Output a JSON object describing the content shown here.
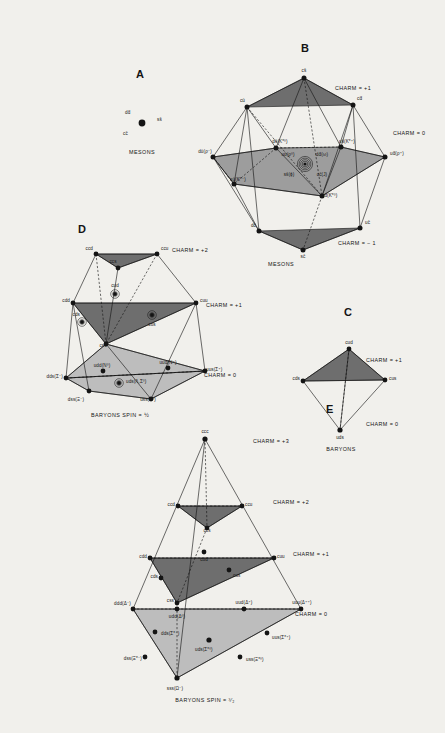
{
  "figure": {
    "panels": [
      {
        "id": "A",
        "label": "A",
        "caption": "MESONS",
        "nodes": [
          {
            "name": "dd-bar",
            "label": "dd̄",
            "x": 125,
            "y": 113,
            "dot": false
          },
          {
            "name": "ss-bar",
            "label": "ss̄",
            "x": 157,
            "y": 118,
            "dot": false
          },
          {
            "name": "cc-bar",
            "label": "cc̄",
            "x": 123,
            "y": 134,
            "dot": false
          },
          {
            "name": "center-dot",
            "label": "",
            "x": 142,
            "y": 123,
            "dot": true
          }
        ]
      },
      {
        "id": "B",
        "label": "B",
        "caption": "MESONS",
        "charm_labels": [
          {
            "text": "CHARM = +1",
            "x": 335,
            "y": 88
          },
          {
            "text": "CHARM = 0",
            "x": 393,
            "y": 133
          },
          {
            "text": "CHARM = − 1",
            "x": 338,
            "y": 243
          }
        ],
        "nodes": [
          {
            "name": "cs-bar",
            "label": "cs̄",
            "x": 304,
            "y": 73
          },
          {
            "name": "cu-bar",
            "label": "cū",
            "x": 243,
            "y": 102
          },
          {
            "name": "cd-bar",
            "label": "cd̄",
            "x": 358,
            "y": 100
          },
          {
            "name": "ds-bar",
            "label": "ds̄(K*⁰)",
            "x": 271,
            "y": 144
          },
          {
            "name": "us-bar",
            "label": "us̄(K*⁺)",
            "x": 339,
            "y": 143
          },
          {
            "name": "su-bar",
            "label": "sū(K*⁻)",
            "x": 230,
            "y": 179
          },
          {
            "name": "sd-bar",
            "label": "sd̄(K*⁰)",
            "x": 318,
            "y": 191
          },
          {
            "name": "du-bar",
            "label": "dū(ρ⁻)",
            "x": 212,
            "y": 152
          },
          {
            "name": "ud-bar",
            "label": "ud̄(ρ⁺)",
            "x": 392,
            "y": 152
          },
          {
            "name": "uu-bar",
            "label": "uū(ρ⁰)",
            "x": 288,
            "y": 156
          },
          {
            "name": "dd-bar",
            "label": "dd̄(ω)",
            "x": 320,
            "y": 156
          },
          {
            "name": "ss-bar",
            "label": "ss̄(ϕ)",
            "x": 289,
            "y": 172
          },
          {
            "name": "cc-bar",
            "label": "cc̄(J)",
            "x": 320,
            "y": 172
          },
          {
            "name": "dc-bar",
            "label": "dc̄",
            "x": 256,
            "y": 226
          },
          {
            "name": "uc-bar",
            "label": "uc̄",
            "x": 364,
            "y": 223
          },
          {
            "name": "sc-bar",
            "label": "sc̄",
            "x": 303,
            "y": 255
          }
        ]
      },
      {
        "id": "C",
        "label": "C",
        "caption": "BARYONS",
        "charm_labels": [
          {
            "text": "CHARM = +1",
            "x": 366,
            "y": 360
          },
          {
            "text": "CHARM = 0",
            "x": 366,
            "y": 424
          }
        ],
        "nodes": [
          {
            "name": "cud",
            "label": "cud",
            "x": 349,
            "y": 344
          },
          {
            "name": "cds",
            "label": "cds",
            "x": 292,
            "y": 377
          },
          {
            "name": "cus",
            "label": "cus",
            "x": 390,
            "y": 376
          },
          {
            "name": "uds",
            "label": "uds",
            "x": 340,
            "y": 434
          }
        ]
      },
      {
        "id": "D",
        "label": "D",
        "caption": "BARYONS SPIN = ½",
        "charm_labels": [
          {
            "text": "CHARM = +2",
            "x": 172,
            "y": 250
          },
          {
            "text": "CHARM = +1",
            "x": 206,
            "y": 305
          },
          {
            "text": "CHARM = 0",
            "x": 204,
            "y": 375
          }
        ],
        "nodes": [
          {
            "name": "ccd",
            "label": "ccd",
            "x": 85,
            "y": 250
          },
          {
            "name": "ccu",
            "label": "ccu",
            "x": 160,
            "y": 250
          },
          {
            "name": "ccs",
            "label": "ccs",
            "x": 113,
            "y": 260
          },
          {
            "name": "cdd",
            "label": "cdd",
            "x": 57,
            "y": 299
          },
          {
            "name": "cud",
            "label": "cud",
            "x": 110,
            "y": 289
          },
          {
            "name": "cuu",
            "label": "cuu",
            "x": 201,
            "y": 299
          },
          {
            "name": "cds",
            "label": "cds",
            "x": 78,
            "y": 313
          },
          {
            "name": "cus",
            "label": "cus",
            "x": 155,
            "y": 323
          },
          {
            "name": "css",
            "label": "css",
            "x": 99,
            "y": 338
          },
          {
            "name": "udd",
            "label": "udd(N⁰)",
            "x": 100,
            "y": 365
          },
          {
            "name": "uud",
            "label": "uud(N⁺)",
            "x": 162,
            "y": 363
          },
          {
            "name": "uds",
            "label": "uds(Λ,Σ⁰)",
            "x": 125,
            "y": 378
          },
          {
            "name": "dds",
            "label": "dds(Σ⁻)",
            "x": 52,
            "y": 374
          },
          {
            "name": "uus",
            "label": "uus(Σ⁺)",
            "x": 196,
            "y": 373
          },
          {
            "name": "dss",
            "label": "dss(Ξ⁻)",
            "x": 72,
            "y": 395
          },
          {
            "name": "uss",
            "label": "uss(Ξ⁰)",
            "x": 142,
            "y": 395
          }
        ]
      },
      {
        "id": "E",
        "label": "E",
        "caption": "BARYONS SPIN = ³⁄₂",
        "charm_labels": [
          {
            "text": "CHARM = +3",
            "x": 253,
            "y": 441
          },
          {
            "text": "CHARM = +2",
            "x": 273,
            "y": 502
          },
          {
            "text": "CHARM = +1",
            "x": 293,
            "y": 554
          },
          {
            "text": "CHARM = 0",
            "x": 295,
            "y": 614
          }
        ],
        "nodes": [
          {
            "name": "ccc",
            "label": "ccc",
            "x": 205,
            "y": 434
          },
          {
            "name": "ccd",
            "label": "ccd",
            "x": 167,
            "y": 502
          },
          {
            "name": "ccu",
            "label": "ccu",
            "x": 253,
            "y": 502
          },
          {
            "name": "ccs",
            "label": "ccs",
            "x": 207,
            "y": 523
          },
          {
            "name": "cdd",
            "label": "cdd",
            "x": 134,
            "y": 554
          },
          {
            "name": "cud",
            "label": "cud",
            "x": 193,
            "y": 564
          },
          {
            "name": "cuu",
            "label": "cuu",
            "x": 285,
            "y": 554
          },
          {
            "name": "cds",
            "label": "cds",
            "x": 152,
            "y": 573
          },
          {
            "name": "cus",
            "label": "cus",
            "x": 238,
            "y": 578
          },
          {
            "name": "css",
            "label": "css",
            "x": 174,
            "y": 598
          },
          {
            "name": "ddd",
            "label": "ddd(Δ⁻)",
            "x": 127,
            "y": 606
          },
          {
            "name": "udd",
            "label": "udd(Δ⁰)",
            "x": 162,
            "y": 620
          },
          {
            "name": "uud",
            "label": "uud(Δ⁺)",
            "x": 242,
            "y": 605
          },
          {
            "name": "uuu",
            "label": "uuu(Δ⁺⁺)",
            "x": 298,
            "y": 605
          },
          {
            "name": "dds",
            "label": "dds(Σ*⁻)",
            "x": 147,
            "y": 637
          },
          {
            "name": "uds",
            "label": "uds(Σ*⁰)",
            "x": 200,
            "y": 648
          },
          {
            "name": "uus",
            "label": "uus(Σ*⁺)",
            "x": 278,
            "y": 641
          },
          {
            "name": "dss",
            "label": "dss(Ξ*⁻)",
            "x": 134,
            "y": 663
          },
          {
            "name": "uss",
            "label": "uss(Ξ*⁰)",
            "x": 248,
            "y": 664
          },
          {
            "name": "sss",
            "label": "sss(Ω⁻)",
            "x": 175,
            "y": 686
          }
        ]
      }
    ],
    "panel_letters": [
      {
        "id": "A",
        "x": 140,
        "y": 78
      },
      {
        "id": "B",
        "x": 305,
        "y": 52
      },
      {
        "id": "C",
        "x": 348,
        "y": 316
      },
      {
        "id": "D",
        "x": 82,
        "y": 233
      },
      {
        "id": "E",
        "x": 330,
        "y": 413
      }
    ],
    "captions": [
      {
        "text": "MESONS",
        "x": 142,
        "y": 152,
        "align": "c"
      },
      {
        "text": "MESONS",
        "x": 268,
        "y": 264,
        "align": "l"
      },
      {
        "text": "BARYONS",
        "x": 341,
        "y": 449,
        "align": "c"
      },
      {
        "text": "BARYONS SPIN = ½",
        "x": 120,
        "y": 415,
        "align": "c"
      },
      {
        "text": "BARYONS SPIN = ³⁄₂",
        "x": 205,
        "y": 700,
        "align": "c"
      }
    ],
    "colors": {
      "background": "#f1f0ec",
      "ink": "#141414",
      "shade_dark": "#6e6e6e",
      "shade_light": "#bdbdbd",
      "shade_mid": "#8f8f8f"
    }
  }
}
